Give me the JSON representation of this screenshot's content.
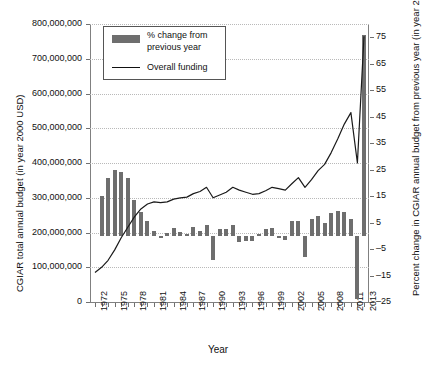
{
  "chart_data": {
    "type": "bar",
    "title": "",
    "xlabel": "Year",
    "ylabel": "CGIAR total annual budget (in year 2000 USD)",
    "ylabel_right": "Percent change in CGIAR annual budget from previous year (in year 2000 USD)",
    "grid": true,
    "legend_position": "top-left",
    "ylim": [
      0,
      800000000
    ],
    "ylim_right": [
      -25,
      80
    ],
    "xlim": [
      1972,
      2013
    ],
    "yticks": [
      0,
      100000000,
      200000000,
      300000000,
      400000000,
      500000000,
      600000000,
      700000000,
      800000000
    ],
    "ytick_labels": [
      "0",
      "100,000,000",
      "200,000,000",
      "300,000,000",
      "400,000,000",
      "500,000,000",
      "600,000,000",
      "700,000,000",
      "800,000,000"
    ],
    "yticks_right": [
      -25,
      -15,
      -5,
      5,
      15,
      25,
      35,
      45,
      55,
      65,
      75
    ],
    "ytick_labels_right": [
      "–25",
      "–15",
      "–5",
      "5",
      "15",
      "25",
      "35",
      "45",
      "55",
      "65",
      "75"
    ],
    "xticks": [
      1972,
      1975,
      1978,
      1981,
      1984,
      1987,
      1990,
      1993,
      1996,
      1999,
      2002,
      2005,
      2008,
      2011,
      2013
    ],
    "xtick_labels": [
      "1972",
      "1975",
      "1978",
      "1981",
      "1984",
      "1987",
      "1990",
      "1993",
      "1996",
      "1999",
      "2002",
      "2005",
      "2008",
      "2011",
      "2013"
    ],
    "x": [
      1972,
      1973,
      1974,
      1975,
      1976,
      1977,
      1978,
      1979,
      1980,
      1981,
      1982,
      1983,
      1984,
      1985,
      1986,
      1987,
      1988,
      1989,
      1990,
      1991,
      1992,
      1993,
      1994,
      1995,
      1996,
      1997,
      1998,
      1999,
      2000,
      2001,
      2002,
      2003,
      2004,
      2005,
      2006,
      2007,
      2008,
      2009,
      2010,
      2011,
      2012,
      2013
    ],
    "series": [
      {
        "name": "Overall funding",
        "type": "line",
        "axis": "left",
        "color": "#1a1a1a",
        "values": [
          85000000,
          100000000,
          120000000,
          150000000,
          185000000,
          215000000,
          245000000,
          268000000,
          282000000,
          288000000,
          286000000,
          288000000,
          296000000,
          300000000,
          302000000,
          312000000,
          318000000,
          330000000,
          300000000,
          308000000,
          316000000,
          330000000,
          322000000,
          316000000,
          310000000,
          312000000,
          320000000,
          330000000,
          326000000,
          322000000,
          340000000,
          358000000,
          330000000,
          352000000,
          378000000,
          396000000,
          430000000,
          470000000,
          512000000,
          545000000,
          400000000,
          765000000
        ]
      },
      {
        "name": "% change from previous year",
        "type": "bar",
        "axis": "right",
        "color": "#6e6e6e",
        "values": [
          null,
          15.0,
          22.0,
          25.0,
          24.0,
          22.0,
          13.5,
          9.0,
          5.5,
          2.0,
          -1.0,
          1.0,
          3.0,
          1.5,
          0.5,
          3.5,
          2.0,
          4.0,
          -9.0,
          2.5,
          2.5,
          4.0,
          -2.5,
          -2.0,
          -2.0,
          0.5,
          2.5,
          3.0,
          -1.0,
          -1.5,
          5.5,
          5.5,
          -8.0,
          6.5,
          7.5,
          5.0,
          8.5,
          9.5,
          9.0,
          6.5,
          -24.0,
          76.0
        ]
      }
    ]
  },
  "legend": {
    "entry_bar_line1": "% change from",
    "entry_bar_line2": "previous year",
    "entry_line": "Overall funding"
  },
  "axes": {
    "x_title": "Year",
    "y_title_left": "CGIAR total annual budget (in year 2000 USD)",
    "y_title_right": "Percent change in CGIAR annual budget from previous year (in year 2000 USD)"
  }
}
